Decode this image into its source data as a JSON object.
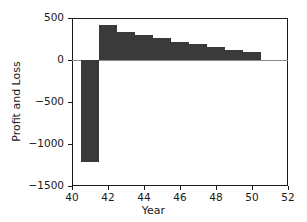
{
  "chart_data": {
    "type": "bar",
    "title": "",
    "subtitle": "",
    "xlabel": "Year",
    "ylabel": "Profit and Loss",
    "x": [
      41,
      42,
      43,
      44,
      45,
      46,
      47,
      48,
      49,
      50,
      51
    ],
    "values": [
      -1210,
      420,
      335,
      295,
      260,
      220,
      190,
      155,
      125,
      95,
      0
    ],
    "bars": [
      {
        "x": 41,
        "value": -1210
      },
      {
        "x": 42,
        "value": 420
      },
      {
        "x": 43,
        "value": 335
      },
      {
        "x": 44,
        "value": 295
      },
      {
        "x": 45,
        "value": 260
      },
      {
        "x": 46,
        "value": 220
      },
      {
        "x": 47,
        "value": 190
      },
      {
        "x": 48,
        "value": 155
      },
      {
        "x": 49,
        "value": 125
      },
      {
        "x": 50,
        "value": 95
      }
    ],
    "bar_width": 1.0,
    "bar_color": "#3a3a3a",
    "xlim": [
      40,
      52
    ],
    "ylim": [
      -1500,
      500
    ],
    "xticks": [
      40,
      42,
      44,
      46,
      48,
      50,
      52
    ],
    "xtick_labels": [
      "40",
      "42",
      "44",
      "46",
      "48",
      "50",
      "52"
    ],
    "yticks": [
      500,
      0,
      -500,
      -1000,
      -1500
    ],
    "ytick_labels": [
      "500",
      "0",
      "−500",
      "−1000",
      "−1500"
    ],
    "grid": false,
    "legend": null,
    "background": "#ffffff",
    "axis_color": "#1a1a1a"
  }
}
